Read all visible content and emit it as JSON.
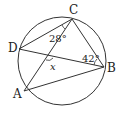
{
  "diagram": {
    "type": "geometry-inscribed-quadrilateral",
    "circle": {
      "cx": 62,
      "cy": 61,
      "r": 44
    },
    "points": {
      "A": {
        "label": "A",
        "x": 24,
        "y": 91
      },
      "B": {
        "label": "B",
        "x": 104,
        "y": 67
      },
      "C": {
        "label": "C",
        "x": 72,
        "y": 19
      },
      "D": {
        "label": "D",
        "x": 19,
        "y": 49
      }
    },
    "segments": [
      "CD",
      "CB",
      "CA",
      "DB",
      "AB"
    ],
    "angles": [
      {
        "label": "28°",
        "at": "C",
        "between": [
          "D",
          "A"
        ]
      },
      {
        "label": "42°",
        "at": "B",
        "between": [
          "D",
          "C"
        ]
      },
      {
        "label": "x",
        "at": "intersection of AC and DB",
        "variable": true
      }
    ],
    "stroke_color": "#333333"
  }
}
